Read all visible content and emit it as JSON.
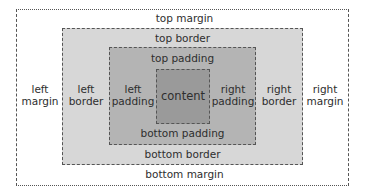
{
  "diagram": {
    "colors": {
      "background": "#ffffff",
      "margin": "#ffffff",
      "border": "#d7d7d7",
      "padding": "#b4b4b4",
      "content": "#9a9a9a",
      "outline": "#555555"
    },
    "margin": {
      "top": "top margin",
      "bottom": "bottom margin",
      "left": [
        "left",
        "margin"
      ],
      "right": [
        "right",
        "margin"
      ]
    },
    "border": {
      "top": "top border",
      "bottom": "bottom border",
      "left": [
        "left",
        "border"
      ],
      "right": [
        "right",
        "border"
      ]
    },
    "padding": {
      "top": "top padding",
      "bottom": "bottom padding",
      "left": [
        "left",
        "padding"
      ],
      "right": [
        "right",
        "padding"
      ]
    },
    "content": "content"
  }
}
